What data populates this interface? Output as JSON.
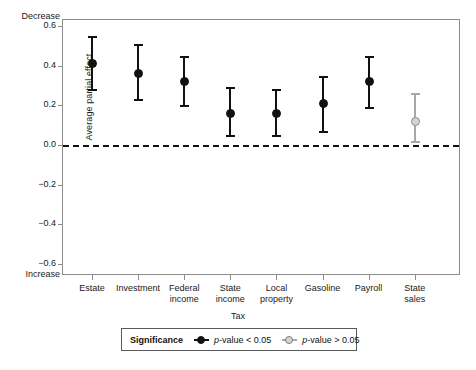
{
  "chart_data": {
    "type": "scatter",
    "title": "",
    "xlabel": "Tax",
    "ylabel": "Average partial effect",
    "ylim": [
      -0.6,
      0.6
    ],
    "yticks": [
      0.6,
      0.4,
      0.2,
      0.0,
      -0.2,
      -0.4,
      -0.6
    ],
    "ytick_labels": [
      "0.6",
      "0.4",
      "0.2",
      "0.0",
      "−0.2",
      "−0.4",
      "−0.6"
    ],
    "grid": false,
    "reference_line": 0.0,
    "axis_top_note": "Decrease",
    "axis_bottom_note": "Increase",
    "categories": [
      "Estate",
      "Investment",
      "Federal income",
      "State income",
      "Local property",
      "Gasoline",
      "Payroll",
      "State sales"
    ],
    "category_labels": [
      [
        "Estate",
        ""
      ],
      [
        "Investment",
        ""
      ],
      [
        "Federal",
        "income"
      ],
      [
        "State",
        "income"
      ],
      [
        "Local",
        "property"
      ],
      [
        "Gasoline",
        ""
      ],
      [
        "Payroll",
        ""
      ],
      [
        "State",
        "sales"
      ]
    ],
    "points": [
      {
        "category": "Estate",
        "estimate": 0.41,
        "ci_low": 0.27,
        "ci_high": 0.55,
        "significant": true
      },
      {
        "category": "Investment",
        "estimate": 0.36,
        "ci_low": 0.22,
        "ci_high": 0.51,
        "significant": true
      },
      {
        "category": "Federal income",
        "estimate": 0.32,
        "ci_low": 0.19,
        "ci_high": 0.45,
        "significant": true
      },
      {
        "category": "State income",
        "estimate": 0.16,
        "ci_low": 0.04,
        "ci_high": 0.29,
        "significant": true
      },
      {
        "category": "Local property",
        "estimate": 0.16,
        "ci_low": 0.04,
        "ci_high": 0.28,
        "significant": true
      },
      {
        "category": "Gasoline",
        "estimate": 0.21,
        "ci_low": 0.06,
        "ci_high": 0.35,
        "significant": true
      },
      {
        "category": "Payroll",
        "estimate": 0.32,
        "ci_low": 0.18,
        "ci_high": 0.45,
        "significant": true
      },
      {
        "category": "State sales",
        "estimate": 0.12,
        "ci_low": 0.01,
        "ci_high": 0.26,
        "significant": false
      }
    ],
    "legend": {
      "position": "bottom",
      "title": "Significance",
      "entries": [
        {
          "label": "p-value < 0.05",
          "italic_prefix": "p",
          "rest": "-value < 0.05",
          "significant": true,
          "color": "#111111"
        },
        {
          "label": "p-value > 0.05",
          "italic_prefix": "p",
          "rest": "-value > 0.05",
          "significant": false,
          "color": "#a8a8a8"
        }
      ]
    },
    "colors": {
      "significant": "#111111",
      "not_significant": "#a8a8a8",
      "axis": "#8c8c8c",
      "background": "#ffffff"
    }
  }
}
